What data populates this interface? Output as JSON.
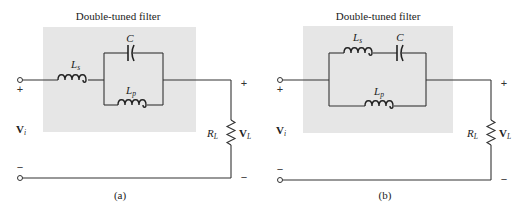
{
  "figure": {
    "panels": [
      {
        "id": "a",
        "title": "Double-tuned filter",
        "caption": "(a)",
        "topology": "Ls in series with (C parallel Lp)",
        "components": {
          "series_inductor": {
            "symbol": "L",
            "subscript": "s"
          },
          "capacitor": {
            "symbol": "C"
          },
          "parallel_inductor": {
            "symbol": "L",
            "subscript": "p"
          },
          "load_resistor": {
            "symbol": "R",
            "subscript": "L"
          }
        },
        "input": {
          "plus": "+",
          "minus": "−",
          "voltage": "V",
          "voltage_sub": "i"
        },
        "output": {
          "plus": "+",
          "minus": "−",
          "voltage": "V",
          "voltage_sub": "L"
        }
      },
      {
        "id": "b",
        "title": "Double-tuned filter",
        "caption": "(b)",
        "topology": "(Ls series C) parallel Lp",
        "components": {
          "series_inductor": {
            "symbol": "L",
            "subscript": "s"
          },
          "capacitor": {
            "symbol": "C"
          },
          "parallel_inductor": {
            "symbol": "L",
            "subscript": "p"
          },
          "load_resistor": {
            "symbol": "R",
            "subscript": "L"
          }
        },
        "input": {
          "plus": "+",
          "minus": "−",
          "voltage": "V",
          "voltage_sub": "i"
        },
        "output": {
          "plus": "+",
          "minus": "−",
          "voltage": "V",
          "voltage_sub": "L"
        }
      }
    ],
    "colors": {
      "filter_box": "#e6e6e6",
      "wire": "#333333",
      "background": "#ffffff"
    }
  }
}
